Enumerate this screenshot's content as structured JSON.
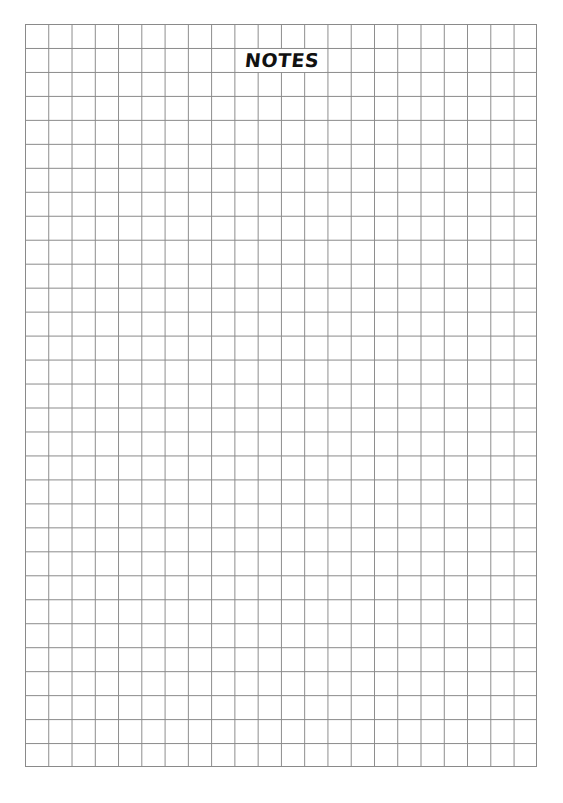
{
  "page": {
    "title": "NOTES",
    "grid": {
      "columns": 22,
      "rows": 31,
      "line_color": "#8a8a8a"
    }
  }
}
